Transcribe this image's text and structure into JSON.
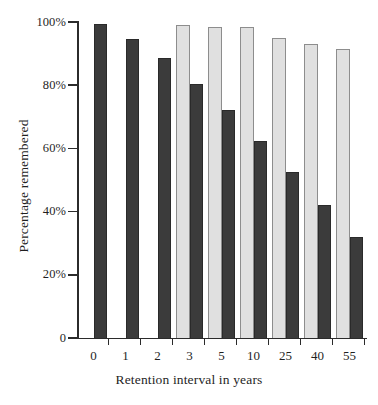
{
  "chart_data": {
    "type": "bar",
    "title": "",
    "xlabel": "Retention interval in years",
    "ylabel": "Percentage remembered",
    "categories": [
      "0",
      "1",
      "2",
      "3",
      "5",
      "10",
      "25",
      "40",
      "55"
    ],
    "ylim": [
      0,
      100
    ],
    "yticks": [
      0,
      20,
      40,
      60,
      80,
      100
    ],
    "ytick_labels": [
      "0",
      "20%",
      "40%",
      "60%",
      "80%",
      "100%"
    ],
    "grid": false,
    "legend": "none",
    "series": [
      {
        "name": "light-series",
        "color": "#e0e0e0",
        "values": [
          null,
          null,
          null,
          99,
          98.5,
          98.5,
          95,
          93,
          91.5
        ]
      },
      {
        "name": "dark-series",
        "color": "#3b3b3b",
        "values": [
          99.5,
          94.5,
          88.5,
          80.5,
          72,
          62.5,
          52.5,
          42,
          32
        ]
      }
    ]
  },
  "axes": {
    "x_title": "Retention interval in years",
    "y_title": "Percentage remembered"
  }
}
